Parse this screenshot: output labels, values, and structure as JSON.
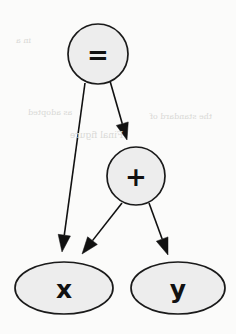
{
  "figure": {
    "background_color": "#fbfbfa",
    "width": 236,
    "height": 334
  },
  "style": {
    "node_fill": "#ededed",
    "node_stroke": "#1a1a1a",
    "edge_color": "#111111",
    "label_color": "#111111",
    "bleed_color": "#d9d9d6"
  },
  "nodes": [
    {
      "id": "eq",
      "label": "=",
      "shape": "circle",
      "cx": 98,
      "cy": 54,
      "rx": 30,
      "ry": 30,
      "font_size": 26
    },
    {
      "id": "plus",
      "label": "+",
      "shape": "circle",
      "cx": 136,
      "cy": 176,
      "rx": 29,
      "ry": 29,
      "font_size": 26
    },
    {
      "id": "x",
      "label": "x",
      "shape": "ellipse",
      "cx": 64,
      "cy": 288,
      "rx": 49,
      "ry": 26,
      "font_size": 25
    },
    {
      "id": "y",
      "label": "y",
      "shape": "ellipse",
      "cx": 178,
      "cy": 288,
      "rx": 47,
      "ry": 26,
      "font_size": 25
    }
  ],
  "edges": [
    {
      "id": "eq-to-x",
      "from": "eq",
      "to": "x",
      "x1": 85,
      "y1": 83,
      "x2": 62,
      "y2": 252
    },
    {
      "id": "eq-to-plus",
      "from": "eq",
      "to": "plus",
      "x1": 110,
      "y1": 81,
      "x2": 127,
      "y2": 140
    },
    {
      "id": "plus-to-x",
      "from": "plus",
      "to": "x",
      "x1": 122,
      "y1": 203,
      "x2": 82,
      "y2": 254
    },
    {
      "id": "plus-to-y",
      "from": "plus",
      "to": "y",
      "x1": 149,
      "y1": 203,
      "x2": 168,
      "y2": 255
    }
  ],
  "bleed_marks": [
    {
      "text": "in a",
      "x": 16,
      "y": 36,
      "size": 8
    },
    {
      "text": "as adopted",
      "x": 28,
      "y": 108,
      "size": 8
    },
    {
      "text": "the standard of",
      "x": 150,
      "y": 112,
      "size": 8
    },
    {
      "text": "Final figure",
      "x": 70,
      "y": 130,
      "size": 9
    }
  ]
}
